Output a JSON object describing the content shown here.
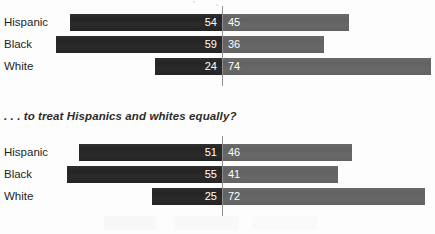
{
  "chart_data": {
    "type": "bar",
    "subtype": "diverging-stacked-bar",
    "title": "",
    "xlabel": "",
    "ylabel": "",
    "categories": [
      "Hispanic",
      "Black",
      "White"
    ],
    "axis": {
      "center_value": 0,
      "units": "percent",
      "grid": false,
      "legend": null
    },
    "panels": [
      {
        "subtitle": "",
        "series": [
          {
            "name": "left",
            "color": "#242424",
            "values": [
              54,
              59,
              24
            ]
          },
          {
            "name": "right",
            "color": "#626262",
            "values": [
              45,
              36,
              74
            ]
          }
        ],
        "rows": [
          {
            "label": "Hispanic",
            "left": 54,
            "right": 45
          },
          {
            "label": "Black",
            "left": 59,
            "right": 36
          },
          {
            "label": "White",
            "left": 24,
            "right": 74
          }
        ]
      },
      {
        "subtitle": ". . . to treat Hispanics and whites equally?",
        "series": [
          {
            "name": "left",
            "color": "#242424",
            "values": [
              51,
              55,
              25
            ]
          },
          {
            "name": "right",
            "color": "#626262",
            "values": [
              46,
              41,
              72
            ]
          }
        ],
        "rows": [
          {
            "label": "Hispanic",
            "left": 51,
            "right": 46
          },
          {
            "label": "Black",
            "left": 55,
            "right": 41
          },
          {
            "label": "White",
            "left": 25,
            "right": 72
          }
        ]
      }
    ]
  },
  "panels": [
    {
      "subtitle": "",
      "rows": [
        {
          "label": "Hispanic",
          "left_value": "54",
          "right_value": "45"
        },
        {
          "label": "Black",
          "left_value": "59",
          "right_value": "36"
        },
        {
          "label": "White",
          "left_value": "24",
          "right_value": "74"
        }
      ]
    },
    {
      "subtitle": ". . . to treat Hispanics and whites equally?",
      "rows": [
        {
          "label": "Hispanic",
          "left_value": "51",
          "right_value": "46"
        },
        {
          "label": "Black",
          "left_value": "55",
          "right_value": "41"
        },
        {
          "label": "White",
          "left_value": "25",
          "right_value": "72"
        }
      ]
    }
  ],
  "colors": {
    "left_bar": "#242424",
    "right_bar": "#626262",
    "axis_line": "#8e8e8e",
    "text": "#1f1f1f",
    "value_text": "#ffffff",
    "background": "#fdfdfd"
  }
}
